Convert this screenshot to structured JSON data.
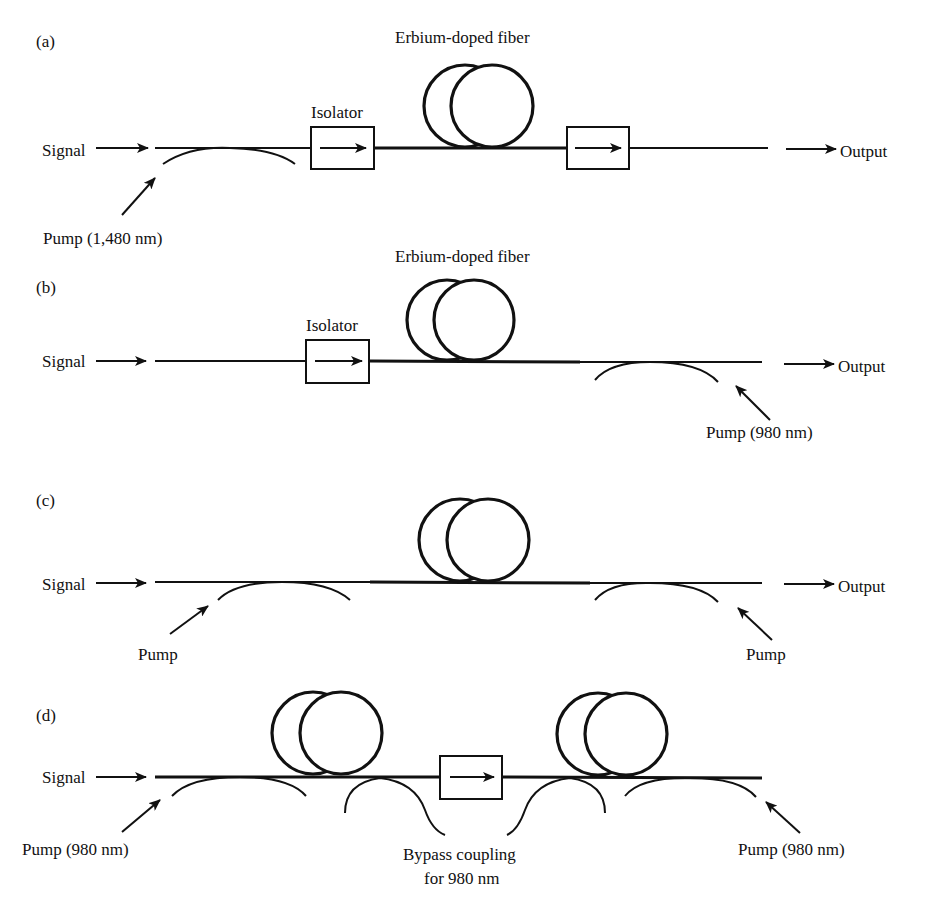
{
  "figure": {
    "panels": [
      {
        "id": "a",
        "label": "(a)",
        "fiber_label": "Erbium-doped fiber",
        "isolator_label": "Isolator",
        "input_label": "Signal",
        "output_label": "Output",
        "pumps": [
          {
            "label": "Pump (1,480 nm)",
            "position": "input"
          }
        ]
      },
      {
        "id": "b",
        "label": "(b)",
        "fiber_label": "Erbium-doped fiber",
        "isolator_label": "Isolator",
        "input_label": "Signal",
        "output_label": "Output",
        "pumps": [
          {
            "label": "Pump (980 nm)",
            "position": "output"
          }
        ]
      },
      {
        "id": "c",
        "label": "(c)",
        "input_label": "Signal",
        "output_label": "Output",
        "pumps": [
          {
            "label": "Pump",
            "position": "input"
          },
          {
            "label": "Pump",
            "position": "output"
          }
        ]
      },
      {
        "id": "d",
        "label": "(d)",
        "input_label": "Signal",
        "bypass_label_line1": "Bypass coupling",
        "bypass_label_line2": "for 980 nm",
        "pumps": [
          {
            "label": "Pump (980 nm)",
            "position": "input"
          },
          {
            "label": "Pump (980 nm)",
            "position": "output"
          }
        ]
      }
    ],
    "colors": {
      "ink": "#111111",
      "background": "#ffffff"
    }
  }
}
